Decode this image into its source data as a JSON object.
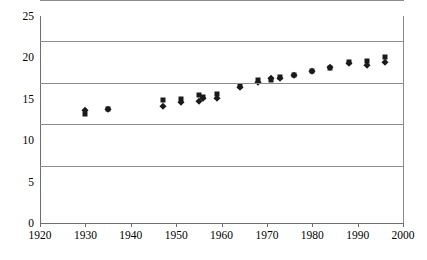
{
  "chart_data": {
    "type": "scatter",
    "title": "",
    "xlabel": "",
    "ylabel": "",
    "xlim": [
      1920,
      2000
    ],
    "ylim": [
      0,
      25
    ],
    "xticks": [
      1920,
      1930,
      1940,
      1950,
      1960,
      1970,
      1980,
      1990,
      2000
    ],
    "yticks": [
      0,
      5,
      10,
      15,
      20,
      25
    ],
    "grid": true,
    "legend": "none",
    "marker_color": "#1a1a1a",
    "series": [
      {
        "name": "series-squares",
        "marker": "square",
        "points": [
          {
            "x": 1930,
            "y": 13.2
          },
          {
            "x": 1935,
            "y": 13.8
          },
          {
            "x": 1947,
            "y": 14.9
          },
          {
            "x": 1951,
            "y": 15.0
          },
          {
            "x": 1955,
            "y": 15.4
          },
          {
            "x": 1956,
            "y": 15.2
          },
          {
            "x": 1959,
            "y": 15.6
          },
          {
            "x": 1964,
            "y": 16.5
          },
          {
            "x": 1968,
            "y": 17.3
          },
          {
            "x": 1971,
            "y": 17.3
          },
          {
            "x": 1973,
            "y": 17.6
          },
          {
            "x": 1976,
            "y": 17.9
          },
          {
            "x": 1980,
            "y": 18.3
          },
          {
            "x": 1984,
            "y": 18.7
          },
          {
            "x": 1988,
            "y": 19.4
          },
          {
            "x": 1992,
            "y": 19.6
          },
          {
            "x": 1996,
            "y": 20.0
          }
        ]
      },
      {
        "name": "series-diamonds",
        "marker": "diamond",
        "points": [
          {
            "x": 1930,
            "y": 13.7
          },
          {
            "x": 1935,
            "y": 13.8
          },
          {
            "x": 1947,
            "y": 14.1
          },
          {
            "x": 1951,
            "y": 14.6
          },
          {
            "x": 1955,
            "y": 14.7
          },
          {
            "x": 1956,
            "y": 15.1
          },
          {
            "x": 1959,
            "y": 15.1
          },
          {
            "x": 1964,
            "y": 16.4
          },
          {
            "x": 1968,
            "y": 17.0
          },
          {
            "x": 1971,
            "y": 17.5
          },
          {
            "x": 1973,
            "y": 17.5
          },
          {
            "x": 1976,
            "y": 17.9
          },
          {
            "x": 1980,
            "y": 18.3
          },
          {
            "x": 1984,
            "y": 18.9
          },
          {
            "x": 1988,
            "y": 19.3
          },
          {
            "x": 1992,
            "y": 19.1
          },
          {
            "x": 1996,
            "y": 19.5
          }
        ]
      }
    ]
  }
}
